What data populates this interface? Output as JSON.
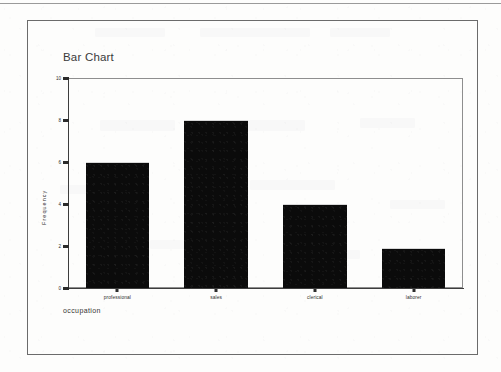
{
  "document": {
    "kind": "scanned-page",
    "background_color": "#fdfdfc",
    "border_color": "#6b6b6b"
  },
  "chart_data": {
    "type": "bar",
    "title": "Bar Chart",
    "xlabel": "occupation",
    "ylabel": "Frequency",
    "categories": [
      "professional",
      "sales",
      "clerical",
      "laborer"
    ],
    "values": [
      6,
      8,
      4,
      1.9
    ],
    "ylim": [
      0,
      10
    ],
    "yticks": [
      0,
      2,
      4,
      6,
      8,
      10
    ],
    "ytick_labels": [
      "0",
      "2",
      "4",
      "6",
      "8",
      "10"
    ],
    "grid": false,
    "legend": null,
    "bar_color": "#0b0b0b",
    "axis_color": "#3d3d3d",
    "frame_color": "#8e8e8e"
  }
}
